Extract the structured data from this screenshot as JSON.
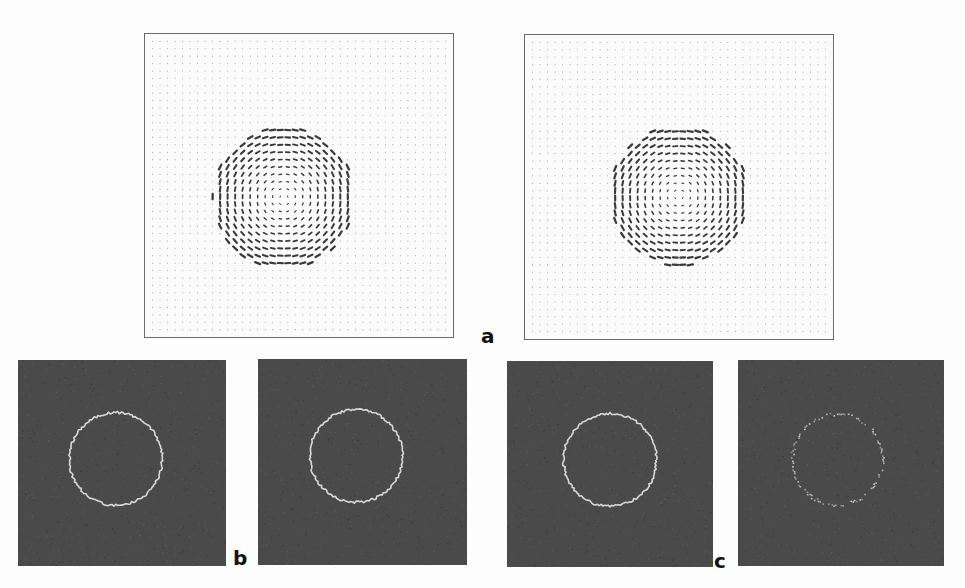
{
  "figure": {
    "labels": {
      "a": "a",
      "b": "b",
      "c": "c"
    },
    "colors": {
      "background": "#fdfdfd",
      "vector_panel_bg": "#fbfbfb",
      "vector_panel_border": "#6a6a6a",
      "grid_dot": "#9a9a9a",
      "vector_arrow": "#3a3a3a",
      "edge_panel_bg": "#4a4a4a",
      "edge_ring": "#d8d8d8"
    },
    "panels": {
      "a": [
        {
          "id": "a-left",
          "type": "vector-field",
          "grid": 40,
          "vortex": {
            "cx": 0.45,
            "cy": 0.54,
            "r": 0.235
          }
        },
        {
          "id": "a-right",
          "type": "vector-field",
          "grid": 40,
          "vortex": {
            "cx": 0.5,
            "cy": 0.53,
            "r": 0.23
          }
        }
      ],
      "b": [
        {
          "id": "b-left",
          "type": "edge-map",
          "ring": {
            "cx": 0.47,
            "cy": 0.48,
            "r": 0.225,
            "style": "solid"
          }
        },
        {
          "id": "b-right",
          "type": "edge-map",
          "ring": {
            "cx": 0.47,
            "cy": 0.47,
            "r": 0.225,
            "style": "solid"
          }
        }
      ],
      "c": [
        {
          "id": "c-left",
          "type": "edge-map",
          "ring": {
            "cx": 0.5,
            "cy": 0.48,
            "r": 0.225,
            "style": "solid"
          }
        },
        {
          "id": "c-right",
          "type": "edge-map",
          "ring": {
            "cx": 0.48,
            "cy": 0.48,
            "r": 0.22,
            "style": "dotted"
          }
        }
      ]
    }
  }
}
